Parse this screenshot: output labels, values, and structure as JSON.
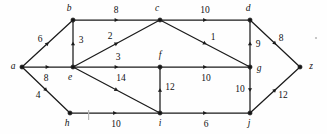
{
  "figure": {
    "background_color": "#fefefe",
    "ink_color": "#1b1b1b"
  },
  "chart_data": {
    "type": "diagram",
    "subtype": "directed-weighted-graph",
    "title": "",
    "xlabel": "",
    "ylabel": "",
    "nodes": [
      {
        "id": "a",
        "label": "a",
        "x": 22,
        "y": 67,
        "label_x": 13,
        "label_y": 67
      },
      {
        "id": "b",
        "label": "b",
        "x": 73,
        "y": 20,
        "label_x": 69,
        "label_y": 9
      },
      {
        "id": "c",
        "label": "c",
        "x": 160,
        "y": 20,
        "label_x": 157,
        "label_y": 9
      },
      {
        "id": "d",
        "label": "d",
        "x": 250,
        "y": 20,
        "label_x": 248,
        "label_y": 9
      },
      {
        "id": "e",
        "label": "e",
        "x": 73,
        "y": 67,
        "label_x": 70,
        "label_y": 78
      },
      {
        "id": "f",
        "label": "f",
        "x": 160,
        "y": 67,
        "label_x": 160,
        "label_y": 56
      },
      {
        "id": "g",
        "label": "g",
        "x": 250,
        "y": 67,
        "label_x": 259,
        "label_y": 69
      },
      {
        "id": "h",
        "label": "h",
        "x": 70,
        "y": 113,
        "label_x": 67,
        "label_y": 124
      },
      {
        "id": "i",
        "label": "i",
        "x": 160,
        "y": 113,
        "label_x": 160,
        "label_y": 124
      },
      {
        "id": "j",
        "label": "j",
        "x": 250,
        "y": 113,
        "label_x": 249,
        "label_y": 124
      },
      {
        "id": "z",
        "label": "z",
        "x": 300,
        "y": 67,
        "label_x": 311,
        "label_y": 67
      }
    ],
    "edges": [
      {
        "from": "a",
        "to": "b",
        "weight": "6",
        "label_x": 40,
        "label_y": 40
      },
      {
        "from": "a",
        "to": "e",
        "weight": "8",
        "label_x": 46,
        "label_y": 79
      },
      {
        "from": "a",
        "to": "h",
        "weight": "4",
        "label_x": 38,
        "label_y": 96
      },
      {
        "from": "e",
        "to": "b",
        "weight": "3",
        "label_x": 81,
        "label_y": 41
      },
      {
        "from": "b",
        "to": "c",
        "weight": "8",
        "label_x": 116,
        "label_y": 11
      },
      {
        "from": "e",
        "to": "c",
        "weight": "2",
        "label_x": 110,
        "label_y": 37
      },
      {
        "from": "e",
        "to": "f",
        "weight": "3",
        "label_x": 118,
        "label_y": 58
      },
      {
        "from": "e",
        "to": "i",
        "weight": "14",
        "label_x": 121,
        "label_y": 79
      },
      {
        "from": "c",
        "to": "d",
        "weight": "10",
        "label_x": 205,
        "label_y": 11
      },
      {
        "from": "c",
        "to": "g",
        "weight": "1",
        "label_x": 213,
        "label_y": 38
      },
      {
        "from": "g",
        "to": "d",
        "weight": "9",
        "label_x": 258,
        "label_y": 45
      },
      {
        "from": "d",
        "to": "z",
        "weight": "8",
        "label_x": 281,
        "label_y": 39
      },
      {
        "from": "f",
        "to": "g",
        "weight": "10",
        "label_x": 206,
        "label_y": 79
      },
      {
        "from": "i",
        "to": "f",
        "weight": "12",
        "label_x": 170,
        "label_y": 88
      },
      {
        "from": "g",
        "to": "j",
        "weight": "10",
        "label_x": 240,
        "label_y": 90
      },
      {
        "from": "h",
        "to": "i",
        "weight": "10",
        "label_x": 116,
        "label_y": 125
      },
      {
        "from": "i",
        "to": "j",
        "weight": "6",
        "label_x": 206,
        "label_y": 125
      },
      {
        "from": "j",
        "to": "z",
        "weight": "12",
        "label_x": 283,
        "label_y": 96
      }
    ]
  }
}
